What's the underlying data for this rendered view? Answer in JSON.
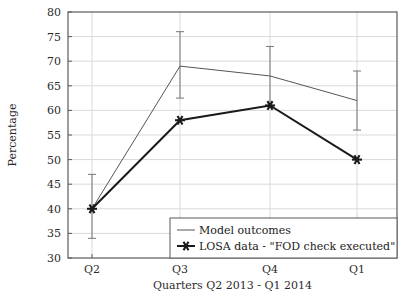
{
  "chart_data": {
    "type": "line",
    "title": "",
    "xlabel": "Quarters Q2 2013 - Q1 2014",
    "ylabel": "Percentage",
    "categories": [
      "Q2",
      "Q3",
      "Q4",
      "Q1"
    ],
    "xtick_labels": [
      "Q2",
      "Q3",
      "Q4",
      "Q1"
    ],
    "ytick_labels": [
      "30",
      "35",
      "40",
      "45",
      "50",
      "55",
      "60",
      "65",
      "70",
      "75",
      "80"
    ],
    "ytick_values": [
      30,
      35,
      40,
      45,
      50,
      55,
      60,
      65,
      70,
      75,
      80
    ],
    "ylim": [
      30,
      80
    ],
    "grid": true,
    "legend_position": "lower right",
    "series": [
      {
        "name": "Model outcomes",
        "values": [
          40,
          69,
          67,
          62
        ],
        "color": "#555555",
        "line_width": 1,
        "marker": "none",
        "error_low": [
          34,
          62.5,
          61,
          56
        ],
        "error_high": [
          47,
          76,
          73,
          68
        ]
      },
      {
        "name": "LOSA data - \"FOD check executed\"",
        "values": [
          40,
          58,
          61,
          50
        ],
        "color": "#1a1a1a",
        "line_width": 2,
        "marker": "star"
      }
    ]
  },
  "legend": {
    "entries": [
      {
        "label": "Model outcomes",
        "marker": "line"
      },
      {
        "label": "LOSA data - \"FOD check executed\"",
        "marker": "star-line"
      }
    ]
  },
  "axes": {
    "y_title": "Percentage",
    "x_title": "Quarters Q2 2013 - Q1 2014"
  },
  "colors": {
    "model_line": "#555555",
    "losa_line": "#1a1a1a",
    "grid": "#d9d9d9",
    "frame": "#5a5a5a",
    "background": "#ffffff",
    "text": "#1a1a1a"
  }
}
